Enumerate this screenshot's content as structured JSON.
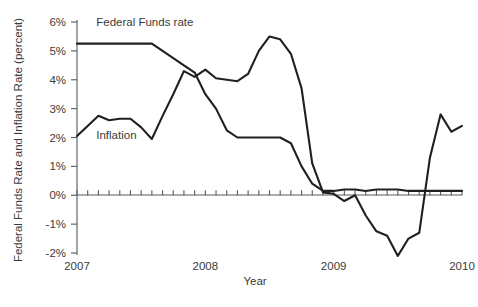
{
  "chart_data": {
    "type": "line",
    "title": "",
    "xlabel": "Year",
    "ylabel": "Federal Funds Rate and Inflation Rate (percent)",
    "xlim": [
      2007.0,
      2010.0
    ],
    "ylim": [
      -2,
      6
    ],
    "y_tick_labels": [
      "6%",
      "5%",
      "4%",
      "3%",
      "2%",
      "1%",
      "0%",
      "-1%",
      "-2%"
    ],
    "y_tick_values": [
      6,
      5,
      4,
      3,
      2,
      1,
      0,
      -1,
      -2
    ],
    "x_tick_labels": [
      "2007",
      "2008",
      "2009",
      "2010"
    ],
    "x_tick_values": [
      2007,
      2008,
      2009,
      2010
    ],
    "minor_ticks": "monthly",
    "grid": false,
    "legend_position": "inline-annotation",
    "series": [
      {
        "name": "Federal Funds rate",
        "annotation_label": "Federal Funds rate",
        "color": "#231f20",
        "x": [
          2007.0,
          2007.083,
          2007.167,
          2007.25,
          2007.333,
          2007.417,
          2007.5,
          2007.583,
          2007.667,
          2007.75,
          2007.833,
          2007.917,
          2008.0,
          2008.083,
          2008.167,
          2008.25,
          2008.333,
          2008.417,
          2008.5,
          2008.583,
          2008.667,
          2008.75,
          2008.833,
          2008.917,
          2009.0,
          2009.083,
          2009.167,
          2009.25,
          2009.333,
          2009.417,
          2009.5,
          2009.583,
          2009.667,
          2009.75,
          2009.833,
          2009.917,
          2010.0
        ],
        "values": [
          5.25,
          5.25,
          5.25,
          5.25,
          5.25,
          5.25,
          5.25,
          5.25,
          5.0,
          4.75,
          4.5,
          4.25,
          3.5,
          3.0,
          2.25,
          2.0,
          2.0,
          2.0,
          2.0,
          2.0,
          1.8,
          1.0,
          0.4,
          0.15,
          0.15,
          0.2,
          0.2,
          0.15,
          0.2,
          0.2,
          0.2,
          0.15,
          0.15,
          0.15,
          0.15,
          0.15,
          0.15
        ]
      },
      {
        "name": "Inflation",
        "annotation_label": "Inflation",
        "color": "#231f20",
        "x": [
          2007.0,
          2007.083,
          2007.167,
          2007.25,
          2007.333,
          2007.417,
          2007.5,
          2007.583,
          2007.667,
          2007.75,
          2007.833,
          2007.917,
          2008.0,
          2008.083,
          2008.167,
          2008.25,
          2008.333,
          2008.417,
          2008.5,
          2008.583,
          2008.667,
          2008.75,
          2008.833,
          2008.917,
          2009.0,
          2009.083,
          2009.167,
          2009.25,
          2009.333,
          2009.417,
          2009.5,
          2009.583,
          2009.667,
          2009.75,
          2009.833,
          2009.917,
          2010.0
        ],
        "values": [
          2.05,
          2.4,
          2.75,
          2.6,
          2.65,
          2.65,
          2.35,
          1.95,
          2.75,
          3.5,
          4.3,
          4.1,
          4.35,
          4.05,
          4.0,
          3.95,
          4.2,
          5.0,
          5.5,
          5.4,
          4.9,
          3.7,
          1.1,
          0.1,
          0.05,
          -0.2,
          0.0,
          -0.7,
          -1.25,
          -1.4,
          -2.1,
          -1.5,
          -1.3,
          1.3,
          2.8,
          2.2,
          2.4
        ]
      }
    ],
    "annotations": [
      {
        "text": "Federal Funds rate",
        "x": 2007.15,
        "y": 5.85
      },
      {
        "text": "Inflation",
        "x": 2007.15,
        "y": 1.95
      }
    ]
  }
}
